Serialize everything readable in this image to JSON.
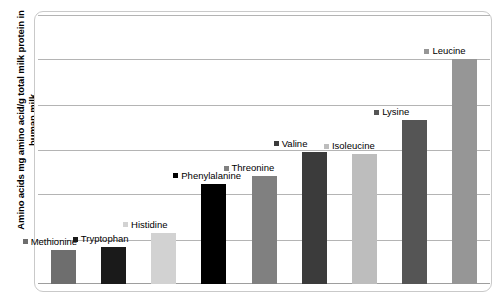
{
  "chart_data": {
    "type": "bar",
    "title": "",
    "xlabel": "",
    "ylabel": "Amino acids mg amino acid/g total milk protein in human milk",
    "categories": [
      "Methionine",
      "Tryptophan",
      "Histidine",
      "Phenylalanine",
      "Threonine",
      "Valine",
      "Isoleucine",
      "Lysine",
      "Leucine"
    ],
    "values": [
      14,
      15,
      21,
      41,
      44,
      54,
      53,
      67,
      92
    ],
    "ylim": [
      0,
      110
    ],
    "grid": true,
    "gridlines": [
      18,
      37,
      55,
      73,
      92,
      110
    ],
    "legend_position": "above-each-bar",
    "series": [
      {
        "name": "Amino acids in human milk",
        "points": [
          {
            "label": "Methionine",
            "value": 14,
            "color": "#6E6E6E"
          },
          {
            "label": "Tryptophan",
            "value": 15,
            "color": "#1A1A1A"
          },
          {
            "label": "Histidine",
            "value": 21,
            "color": "#D2D2D2"
          },
          {
            "label": "Phenylalanine",
            "value": 41,
            "color": "#000000"
          },
          {
            "label": "Threonine",
            "value": 44,
            "color": "#808080"
          },
          {
            "label": "Valine",
            "value": 54,
            "color": "#3B3B3B"
          },
          {
            "label": "Isoleucine",
            "value": 53,
            "color": "#BDBDBD"
          },
          {
            "label": "Lysine",
            "value": 67,
            "color": "#555555"
          },
          {
            "label": "Leucine",
            "value": 92,
            "color": "#969696"
          }
        ]
      }
    ]
  },
  "colors": {
    "frame_border": "#c9c9c9",
    "gridline": "#b4b4b4",
    "axis": "#9e9e9e",
    "background": "#ffffff",
    "text": "#000000"
  }
}
